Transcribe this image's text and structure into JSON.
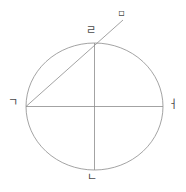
{
  "figure": {
    "canvas": {
      "width": 186,
      "height": 192,
      "background": "#ffffff"
    },
    "stroke_color": "#8c8c8c",
    "stroke_width": 0.8,
    "label_color": "#4a4a4a",
    "ellipse": {
      "center_x": 94.5,
      "center_y": 106.5,
      "radius_x": 68.5,
      "radius_y": 63.5
    },
    "segments": [
      {
        "name": "horizontal-diameter",
        "x1": 26,
        "y1": 106.5,
        "x2": 163,
        "y2": 106.5
      },
      {
        "name": "vertical-diameter",
        "x1": 94.5,
        "y1": 43,
        "x2": 94.5,
        "y2": 170
      },
      {
        "name": "diagonal-ray",
        "x1": 26,
        "y1": 106.5,
        "x2": 123,
        "y2": 20
      }
    ],
    "labels": {
      "left": "ㄱ",
      "right": "ㅓ",
      "bottom": "ㄴ",
      "top": "ㄹ",
      "ray_end": "▫"
    }
  }
}
